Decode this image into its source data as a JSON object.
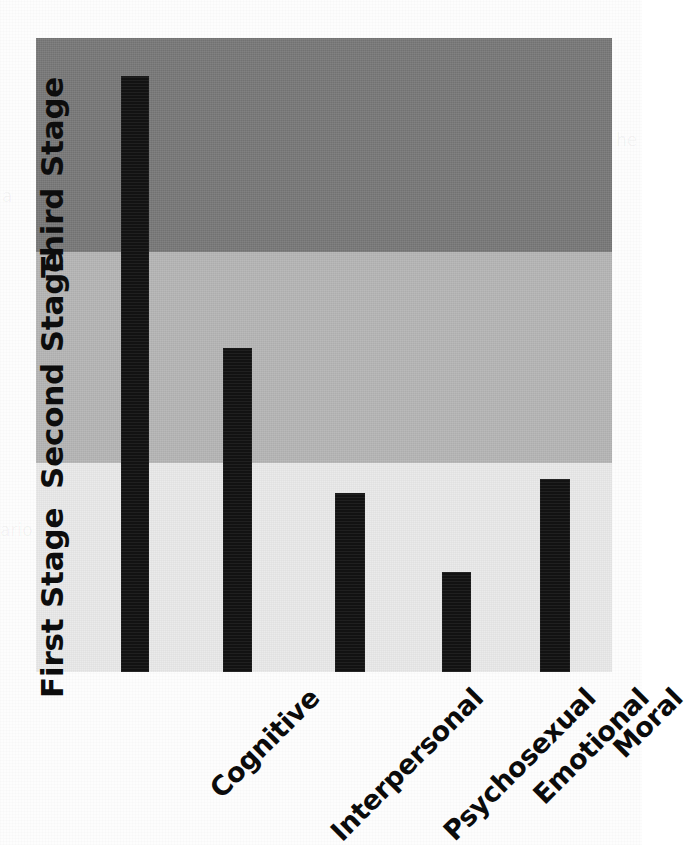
{
  "chart_data": {
    "type": "bar",
    "title": "",
    "subtitle": "",
    "xlabel": "",
    "ylabel": "",
    "categories": [
      "Cognitive",
      "Interpersonal",
      "Psychosexual",
      "Emotional",
      "Moral"
    ],
    "values": [
      3.0,
      1.85,
      0.85,
      0.48,
      0.93
    ],
    "ylim": [
      0,
      3.0
    ],
    "grid": false,
    "legend_position": "none",
    "value_unit": "stage",
    "series": [
      {
        "name": "Developmental stage reached",
        "values": [
          3.0,
          1.85,
          0.85,
          0.48,
          0.93
        ]
      }
    ],
    "bands": [
      {
        "label": "First Stage",
        "range": [
          0.0,
          1.0
        ],
        "color": "#e9e9e9"
      },
      {
        "label": "Second Stage",
        "range": [
          1.0,
          2.0
        ],
        "color": "#b4b4b4"
      },
      {
        "label": "Third Stage",
        "range": [
          2.0,
          3.0
        ],
        "color": "#767676"
      }
    ],
    "bar_color": "#121212",
    "annotations": []
  },
  "figure": {
    "background_color": "#fdfdfd",
    "plot": {
      "bands": [
        {
          "name": "third-stage",
          "label": "Third Stage",
          "color": "#767676",
          "top_px": 0,
          "height_px": 214
        },
        {
          "name": "second-stage",
          "label": "Second Stage",
          "color": "#b4b4b4",
          "top_px": 214,
          "height_px": 211
        },
        {
          "name": "first-stage",
          "label": "First Stage",
          "color": "#e9e9e9",
          "top_px": 425,
          "height_px": 209
        }
      ],
      "bars": [
        {
          "name": "cognitive",
          "label": "Cognitive",
          "left_px": 85,
          "width_px": 28,
          "top_px": 38,
          "height_px": 596
        },
        {
          "name": "interpersonal",
          "label": "Interpersonal",
          "left_px": 187,
          "width_px": 29,
          "top_px": 310,
          "height_px": 324
        },
        {
          "name": "psychosexual",
          "label": "Psychosexual",
          "left_px": 299,
          "width_px": 30,
          "top_px": 455,
          "height_px": 179
        },
        {
          "name": "emotional",
          "label": "Emotional",
          "left_px": 406,
          "width_px": 29,
          "top_px": 534,
          "height_px": 100
        },
        {
          "name": "moral",
          "label": "Moral",
          "left_px": 504,
          "width_px": 30,
          "top_px": 441,
          "height_px": 193
        }
      ],
      "tick_labels": [
        {
          "name": "cognitive",
          "text": "Cognitive",
          "anchor_px": 126
        },
        {
          "name": "interpersonal",
          "text": "Interpersonal",
          "anchor_px": 229
        },
        {
          "name": "psychosexual",
          "text": "Psychosexual",
          "anchor_px": 342
        },
        {
          "name": "emotional",
          "text": "Emotional",
          "anchor_px": 447
        },
        {
          "name": "moral",
          "text": "Moral",
          "anchor_px": 546
        }
      ]
    },
    "scan_ghost_text": [
      {
        "text": "a",
        "left_px": 2,
        "top_px": 186
      },
      {
        "text": "ario",
        "left_px": 0,
        "top_px": 520
      },
      {
        "text": "he",
        "left_px": 616,
        "top_px": 130
      }
    ]
  }
}
